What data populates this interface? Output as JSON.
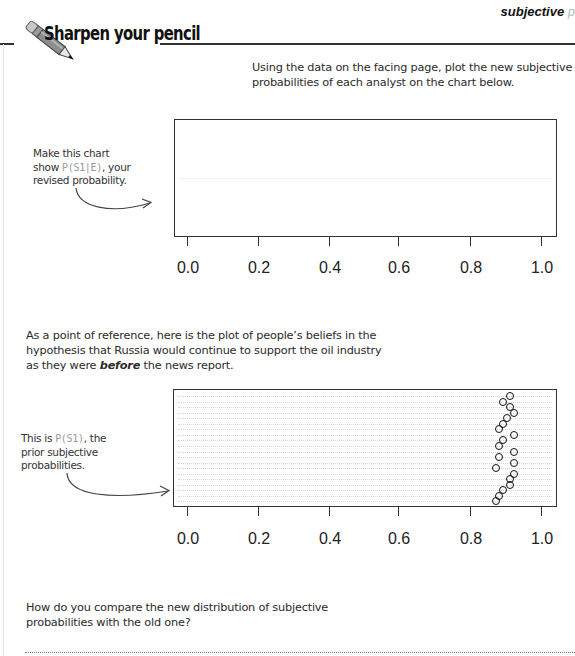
{
  "running_head": {
    "text": "subjective",
    "tail": "p"
  },
  "heading": {
    "title": "Sharpen your pencil",
    "icon": "pencil-icon"
  },
  "instruction": {
    "lines": [
      "Using the data on the facing page, plot the new subjective",
      "probabilities of each analyst on the chart below."
    ]
  },
  "annotation_posterior": {
    "lines": [
      "Make this chart",
      "show ",
      "revised probability."
    ],
    "formula": "P(S1|E)",
    "after_formula": ", your"
  },
  "reference_text": {
    "line1": "As a point of reference, here is the plot of people’s beliefs in the",
    "line2": "hypothesis that Russia would continue to support the oil industry",
    "line3_pre": "as they were ",
    "line3_em": "before",
    "line3_post": " the news report."
  },
  "annotation_prior": {
    "line1_pre": "This is ",
    "formula": "P(S1)",
    "line1_post": ", the",
    "line2": "prior subjective",
    "line3": "probabilities."
  },
  "question": {
    "line1": "How do you compare the new distribution of subjective",
    "line2": "probabilities with the old one?"
  },
  "chart_data": [
    {
      "type": "scatter",
      "title": "",
      "subtitle": "Blank chart for P(S1|E), revised probability",
      "xlabel": "",
      "ylabel": "",
      "xlim": [
        0.0,
        1.0
      ],
      "x_ticks": [
        "0.0",
        "0.2",
        "0.4",
        "0.6",
        "0.8",
        "1.0"
      ],
      "grid": false,
      "legend": "none",
      "series": [
        {
          "name": "P(S1|E)",
          "values": []
        }
      ]
    },
    {
      "type": "scatter",
      "title": "",
      "subtitle": "P(S1), the prior subjective probabilities (dotchart)",
      "xlabel": "",
      "ylabel": "",
      "xlim": [
        0.0,
        1.0
      ],
      "x_ticks": [
        "0.0",
        "0.2",
        "0.4",
        "0.6",
        "0.8",
        "1.0"
      ],
      "grid": true,
      "legend": "none",
      "series": [
        {
          "name": "P(S1)",
          "values": [
            0.91,
            0.89,
            0.91,
            0.92,
            0.9,
            0.89,
            0.88,
            0.92,
            0.89,
            0.88,
            0.92,
            0.88,
            0.92,
            0.87,
            0.92,
            0.91,
            0.91,
            0.89,
            0.88,
            0.87
          ]
        }
      ]
    }
  ]
}
